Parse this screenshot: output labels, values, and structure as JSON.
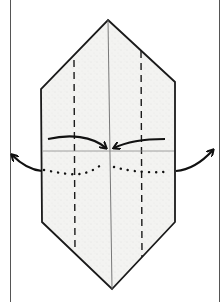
{
  "diagram": {
    "type": "origami-fold-step",
    "colors": {
      "background": "#ffffff",
      "paper": "#f2f2f0",
      "outline": "#1a1a1a",
      "crease": "#6a6a6a",
      "frame": "#555555"
    },
    "shape": {
      "points": [
        [
          108,
          20
        ],
        [
          175,
          82
        ],
        [
          175,
          222
        ],
        [
          112,
          289
        ],
        [
          42,
          222
        ],
        [
          41,
          89
        ]
      ]
    },
    "center_crease": {
      "x1": 108,
      "y1": 20,
      "x2": 112,
      "y2": 289
    },
    "valley_folds": [
      {
        "x1": 74,
        "y1": 60,
        "x2": 75,
        "y2": 252
      },
      {
        "x1": 141,
        "y1": 51,
        "x2": 142,
        "y2": 257
      }
    ],
    "horizontal_crease": {
      "x1": 43,
      "y1": 151,
      "x2": 174,
      "y2": 151
    },
    "arrows": [
      {
        "name": "inward-left",
        "path": "M48,139 C70,134 92,136 106,148"
      },
      {
        "name": "inward-right",
        "path": "M165,139 C148,139 128,141 114,148"
      },
      {
        "name": "outward-left",
        "path": "M42,171 C30,170 20,163 12,155"
      },
      {
        "name": "outward-right",
        "path": "M176,171 C190,170 202,162 213,150"
      }
    ],
    "dotted_curve": "M44,170 C60,173 75,176 85,173 C95,170 100,166 104,162 M114,167 C125,170 140,173 165,172"
  }
}
